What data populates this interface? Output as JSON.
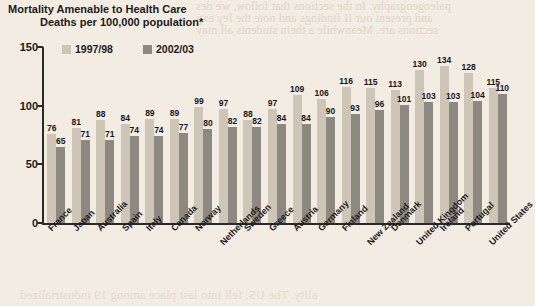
{
  "chart_data": {
    "type": "bar",
    "title": "Mortality Amenable to Health Care",
    "subtitle": "Deaths per 100,000 population*",
    "xlabel": "",
    "ylabel": "",
    "ylim": [
      0,
      150
    ],
    "yticks": [
      "0",
      "50",
      "100",
      "150"
    ],
    "grid": false,
    "legend_position": "top-left",
    "categories": [
      "France",
      "Japan",
      "Australia",
      "Spain",
      "Italy",
      "Canada",
      "Norway",
      "Netherlands",
      "Sweden",
      "Greece",
      "Austria",
      "Germany",
      "Finland",
      "New Zealand",
      "Denmark",
      "United Kingdom",
      "Ireland",
      "Portugal",
      "United States"
    ],
    "series": [
      {
        "name": "1997/98",
        "color": "#cdc5b6",
        "values": [
          76,
          81,
          88,
          84,
          89,
          89,
          99,
          97,
          88,
          97,
          109,
          106,
          116,
          115,
          113,
          130,
          134,
          128,
          115
        ]
      },
      {
        "name": "2002/03",
        "color": "#8d8880",
        "values": [
          65,
          71,
          71,
          74,
          74,
          77,
          80,
          82,
          82,
          84,
          84,
          90,
          93,
          96,
          101,
          103,
          103,
          104,
          110
        ]
      }
    ]
  },
  "ghost_text": {
    "top_line_1": "paleogeography. In the sections that follow, we des",
    "top_line_2": "and present our II findings and note the ley exp",
    "top_line_3": "sections are. Meanwhile a thein students all may",
    "bottom_line": "ality. The US. fell into last place among 19 industrialized"
  }
}
